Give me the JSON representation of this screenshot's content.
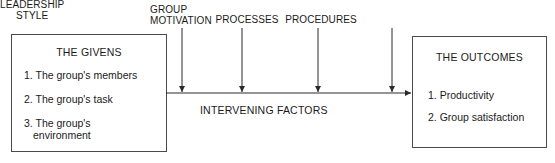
{
  "diagram": {
    "title_text": "Group effectiveness model",
    "stroke_color": "#4a4a4a",
    "background_color": "#ffffff",
    "text_color": "#1a1a1a"
  },
  "givens_box": {
    "title": "THE GIVENS",
    "items": [
      "1. The group's members",
      "2. The group's task",
      "3. The group's",
      "environment"
    ]
  },
  "outcomes_box": {
    "title": "THE OUTCOMES",
    "items": [
      "1. Productivity",
      "2. Group satisfaction"
    ]
  },
  "top_labels": [
    {
      "text": "GROUP\nMOTIVATION",
      "arrow_x": 182
    },
    {
      "text": "PROCESSES",
      "arrow_x": 242
    },
    {
      "text": "PROCEDURES",
      "arrow_x": 318
    },
    {
      "text": "LEADERSHIP\nSTYLE",
      "arrow_x": 392
    }
  ],
  "center_label": {
    "text": "INTERVENING FACTORS"
  },
  "flow": {
    "main_arrow_start_x": 166,
    "main_arrow_end_x": 412,
    "main_arrow_y": 93,
    "vertical_arrow_top_y": 28
  }
}
